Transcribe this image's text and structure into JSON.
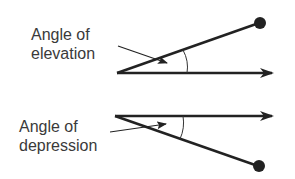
{
  "diagram": {
    "elevation": {
      "label_line1": "Angle of",
      "label_line2": "elevation"
    },
    "depression": {
      "label_line1": "Angle of",
      "label_line2": "depression"
    },
    "colors": {
      "line": "#222222",
      "text": "#3a3a3a",
      "background": "#ffffff"
    }
  }
}
